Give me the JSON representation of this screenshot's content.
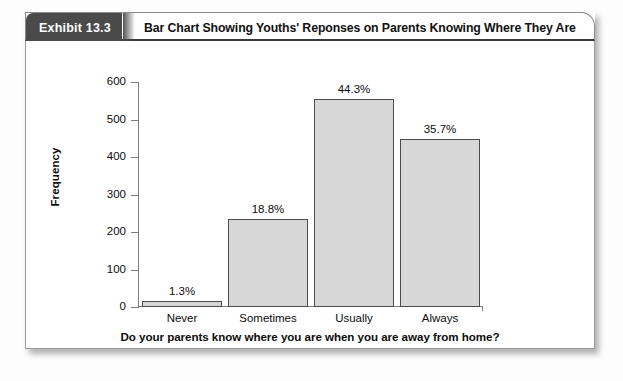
{
  "exhibit": {
    "badge_label": "Exhibit 13.3",
    "title": "Bar Chart Showing Youths' Reponses on Parents Knowing Where They Are"
  },
  "colors": {
    "badge_background": "#4a4a4a",
    "bar_fill": "#d7d7d7",
    "bar_border": "#4c4c4c",
    "axis": "#7d7d7d",
    "text": "#0c0c0c",
    "card_background": "#ffffff"
  },
  "chart_data": {
    "type": "bar",
    "title": "Bar Chart Showing Youths' Reponses on Parents Knowing Where They Are",
    "categories": [
      "Never",
      "Sometimes",
      "Usually",
      "Always"
    ],
    "values": [
      16,
      236,
      556,
      448
    ],
    "data_labels": [
      "1.3%",
      "18.8%",
      "44.3%",
      "35.7%"
    ],
    "percentages": [
      1.3,
      18.8,
      44.3,
      35.7
    ],
    "xlabel": "Do your parents know where you are when you are away from home?",
    "ylabel": "Frequency",
    "ylim": [
      0,
      600
    ],
    "yticks": [
      0,
      100,
      200,
      300,
      400,
      500,
      600
    ],
    "ytick_labels": [
      "0",
      "100",
      "200",
      "300",
      "400",
      "500",
      "600"
    ],
    "grid": false,
    "legend": false
  }
}
